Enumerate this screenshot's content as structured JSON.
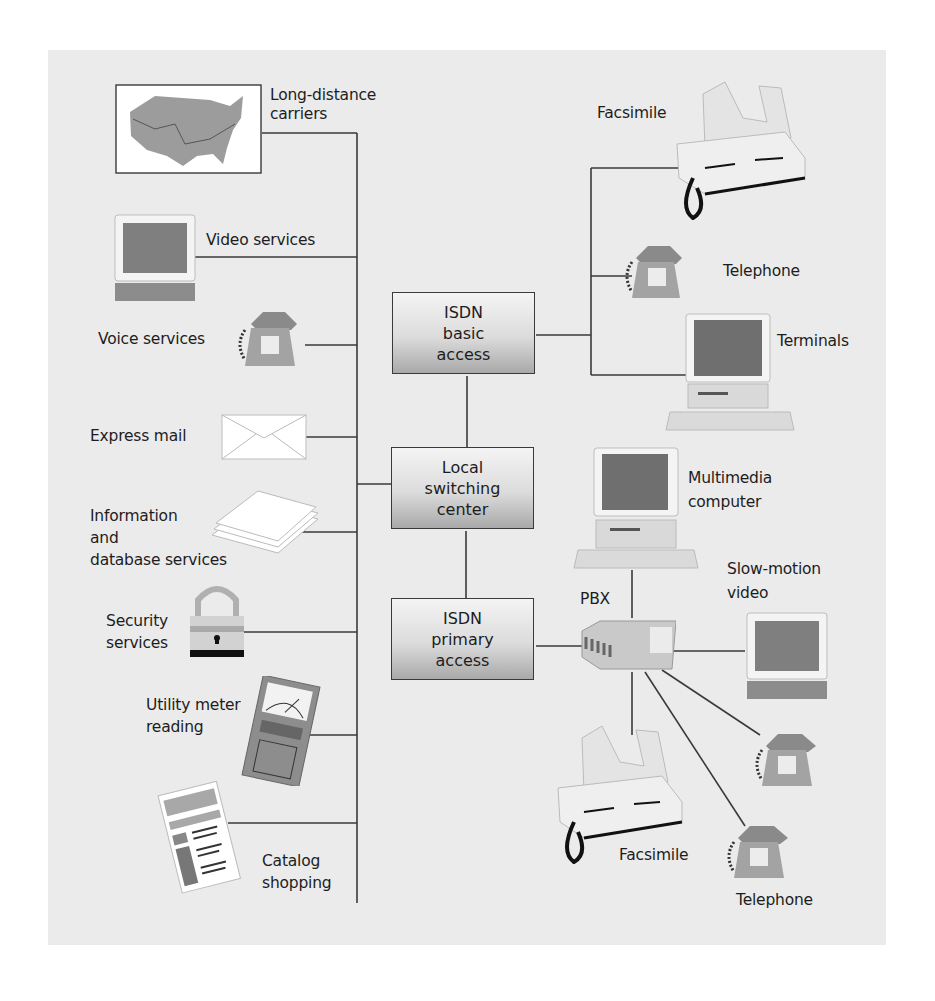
{
  "diagram": {
    "type": "ISDN network services diagram",
    "hubs": {
      "basic_access": [
        "ISDN",
        "basic",
        "access"
      ],
      "local_switching": [
        "Local",
        "switching",
        "center"
      ],
      "primary_access": [
        "ISDN",
        "primary",
        "access"
      ]
    },
    "services": {
      "long_distance": [
        "Long-distance",
        "carriers"
      ],
      "video": "Video services",
      "voice": "Voice services",
      "express_mail": "Express mail",
      "information": [
        "Information",
        "and",
        "database services"
      ],
      "security": [
        "Security",
        "services"
      ],
      "utility": [
        "Utility meter",
        "reading"
      ],
      "catalog": [
        "Catalog",
        "shopping"
      ]
    },
    "basic_devices": {
      "facsimile": "Facsimile",
      "telephone": "Telephone",
      "terminals": "Terminals"
    },
    "primary_devices": {
      "multimedia": [
        "Multimedia",
        "computer"
      ],
      "pbx": "PBX",
      "slow_motion": [
        "Slow-motion",
        "video"
      ],
      "facsimile": "Facsimile",
      "telephone": "Telephone"
    },
    "colors": {
      "panel": "#ebebeb",
      "line": "#3a3a3a",
      "box_top": "#f4f4f4",
      "box_bottom": "#a9a9a9",
      "device": "#9a9a9a"
    }
  }
}
